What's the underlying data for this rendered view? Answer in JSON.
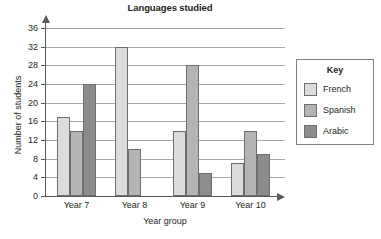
{
  "chart_data": {
    "type": "bar",
    "title": "Languages studied",
    "xlabel": "Year group",
    "ylabel": "Number of students",
    "categories": [
      "Year 7",
      "Year 8",
      "Year 9",
      "Year 10"
    ],
    "series": [
      {
        "name": "French",
        "color": "#dcdcdc",
        "values": [
          17,
          32,
          14,
          7
        ]
      },
      {
        "name": "Spanish",
        "color": "#b4b4b4",
        "values": [
          14,
          10,
          28,
          14
        ]
      },
      {
        "name": "Arabic",
        "color": "#8c8c8c",
        "values": [
          24,
          0,
          5,
          9
        ]
      }
    ],
    "ylim": [
      0,
      36
    ],
    "ytick_step": 4,
    "yticks": [
      0,
      4,
      8,
      12,
      16,
      20,
      24,
      28,
      32,
      36
    ],
    "ytick_labels": [
      "0",
      "4",
      "8",
      "12",
      "16",
      "20",
      "24",
      "28",
      "32",
      "36"
    ],
    "grid": true,
    "grid_axis": "y",
    "legend": {
      "title": "Key",
      "position": "right-outside"
    }
  },
  "legend": {
    "title": "Key",
    "entries": [
      {
        "label": "French",
        "color": "#dcdcdc"
      },
      {
        "label": "Spanish",
        "color": "#b4b4b4"
      },
      {
        "label": "Arabic",
        "color": "#8c8c8c"
      }
    ]
  }
}
